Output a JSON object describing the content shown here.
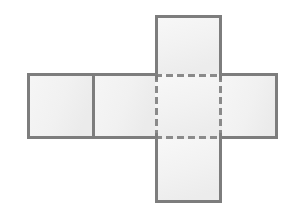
{
  "figure": {
    "title": "Net of a cube (cross layout)",
    "background_color": "#ffffff",
    "canvas": {
      "width": 296,
      "height": 218
    },
    "style": {
      "face_fill": "#f2f2f2",
      "face_fill_light": "#f8f8f8",
      "face_fill_dark": "#eaeaea",
      "solid_stroke_color": "#7d7d7d",
      "solid_stroke_width": 3,
      "dashed_stroke_color": "#8a8a8a",
      "dashed_stroke_width": 3,
      "dash_pattern": "7 4"
    },
    "faces": [
      {
        "id": "top-face",
        "name": "top square",
        "x": 155,
        "y": 15,
        "width": 67,
        "height": 59,
        "edge_style": "solid"
      },
      {
        "id": "left-outer-face",
        "name": "far left square",
        "x": 27,
        "y": 73,
        "width": 66,
        "height": 66,
        "edge_style": "solid"
      },
      {
        "id": "left-inner-face",
        "name": "inner left square",
        "x": 93,
        "y": 73,
        "width": 62,
        "height": 66,
        "edge_style": "solid"
      },
      {
        "id": "center-face",
        "name": "center square",
        "x": 155,
        "y": 74,
        "width": 67,
        "height": 65,
        "edge_style": "dashed"
      },
      {
        "id": "right-face",
        "name": "right square",
        "x": 222,
        "y": 73,
        "width": 56,
        "height": 66,
        "edge_style": "solid"
      },
      {
        "id": "bottom-face",
        "name": "bottom square",
        "x": 155,
        "y": 139,
        "width": 67,
        "height": 64,
        "edge_style": "solid"
      }
    ],
    "dashed_region": {
      "name": "hidden center face",
      "x": 155,
      "y": 74,
      "width": 67,
      "height": 65
    },
    "interior_divider": {
      "name": "vertical divider between left squares",
      "x": 93,
      "y1": 73,
      "y2": 139
    }
  }
}
